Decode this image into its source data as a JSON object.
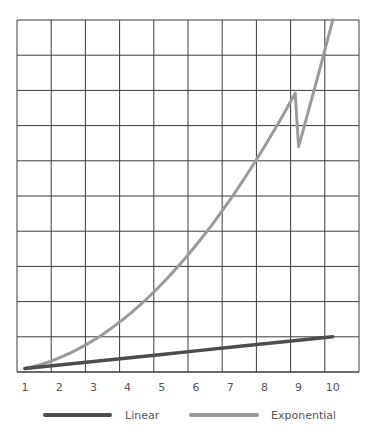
{
  "chart_data": {
    "type": "line",
    "title": "",
    "xlabel": "",
    "ylabel": "",
    "x": [
      1,
      2,
      3,
      4,
      5,
      6,
      7,
      8,
      9,
      10
    ],
    "x_tick_labels": [
      "1",
      "2",
      "3",
      "4",
      "5",
      "6",
      "7",
      "8",
      "9",
      "10"
    ],
    "xlim": [
      1,
      10
    ],
    "ylim": [
      0,
      100
    ],
    "y_grid_step": 10,
    "grid": true,
    "legend_position": "bottom",
    "series": [
      {
        "name": "Linear",
        "color": "#4d4d4d",
        "values": [
          1,
          2,
          3,
          4,
          5,
          6,
          7,
          8,
          9,
          10
        ]
      },
      {
        "name": "Exponential",
        "color": "#9a9a9a",
        "values": [
          1,
          4,
          9,
          16,
          25,
          36,
          49,
          64,
          81,
          100
        ]
      }
    ]
  }
}
